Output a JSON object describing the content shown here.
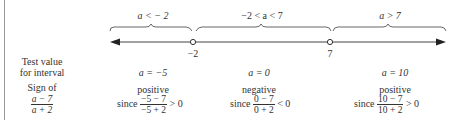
{
  "number_line": {
    "intervals": [
      {
        "label": "a < − 2"
      },
      {
        "label": "−2 < a < 7"
      },
      {
        "label": "a > 7"
      }
    ],
    "points": [
      {
        "label": "−2",
        "value": -2
      },
      {
        "label": "7",
        "value": 7
      }
    ]
  },
  "row_labels": {
    "test_value_line1": "Test value",
    "test_value_line2": "for interval",
    "sign_of": "Sign of",
    "expr_num": "a − 7",
    "expr_den": "a + 2"
  },
  "columns": [
    {
      "test_value": "a  =  −5",
      "sign": "positive",
      "since": "since",
      "num": "−5 − 7",
      "den": "−5 + 2",
      "relation": "> 0"
    },
    {
      "test_value": "a  =  0",
      "sign": "negative",
      "since": "since",
      "num": "0 − 7",
      "den": "0 + 2",
      "relation": "< 0"
    },
    {
      "test_value": "a  =  10",
      "sign": "positive",
      "since": "since",
      "num": "10 − 7",
      "den": "10 + 2",
      "relation": "> 0"
    }
  ]
}
